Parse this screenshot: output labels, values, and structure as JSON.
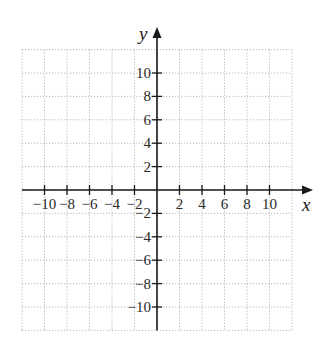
{
  "chart_data": {
    "type": "scatter",
    "title": "",
    "xlabel": "x",
    "ylabel": "y",
    "xlim": [
      -12,
      12
    ],
    "ylim": [
      -12,
      12
    ],
    "grid": true,
    "grid_step": 2,
    "x_ticks": [
      -10,
      -8,
      -6,
      -4,
      -2,
      2,
      4,
      6,
      8,
      10
    ],
    "y_ticks": [
      10,
      8,
      6,
      4,
      2,
      -2,
      -4,
      -6,
      -8,
      -10
    ],
    "x_tick_labels": [
      "−10",
      "−8",
      "−6",
      "−4",
      "−2",
      "2",
      "4",
      "6",
      "8",
      "10"
    ],
    "y_tick_labels": [
      "10",
      "8",
      "6",
      "4",
      "2",
      "−2",
      "−4",
      "−6",
      "−8",
      "−10"
    ],
    "series": [],
    "legend": null
  },
  "colors": {
    "axis": "#1a1a1a",
    "grid": "#b8b8b8"
  }
}
